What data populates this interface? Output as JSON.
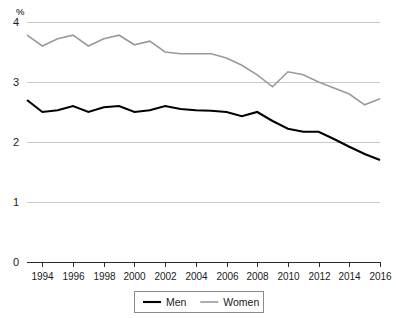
{
  "chart_data": {
    "type": "line",
    "title": "",
    "subtitle": "",
    "xlabel": "",
    "ylabel": "%",
    "unit_label": "%",
    "grid": true,
    "legend_position": "bottom",
    "xlim": [
      1993,
      2016
    ],
    "ylim": [
      0,
      4
    ],
    "ytick_labels": [
      "0",
      "1",
      "2",
      "3",
      "4"
    ],
    "ytick_values": [
      0,
      1,
      2,
      3,
      4
    ],
    "xtick_labels": [
      "1994",
      "1996",
      "1998",
      "2000",
      "2002",
      "2004",
      "2006",
      "2008",
      "2010",
      "2012",
      "2014",
      "2016"
    ],
    "xtick_values": [
      1994,
      1996,
      1998,
      2000,
      2002,
      2004,
      2006,
      2008,
      2010,
      2012,
      2014,
      2016
    ],
    "x": [
      1993,
      1994,
      1995,
      1996,
      1997,
      1998,
      1999,
      2000,
      2001,
      2002,
      2003,
      2004,
      2005,
      2006,
      2007,
      2008,
      2009,
      2010,
      2011,
      2012,
      2013,
      2014,
      2015,
      2016
    ],
    "series": [
      {
        "name": "Men",
        "color": "#000000",
        "width": 2.1,
        "values": [
          2.7,
          2.5,
          2.53,
          2.6,
          2.5,
          2.58,
          2.6,
          2.5,
          2.53,
          2.6,
          2.55,
          2.53,
          2.52,
          2.5,
          2.43,
          2.5,
          2.35,
          2.22,
          2.17,
          2.17,
          2.05,
          1.92,
          1.8,
          1.7
        ]
      },
      {
        "name": "Women",
        "color": "#9a9a9a",
        "width": 1.6,
        "values": [
          3.78,
          3.6,
          3.72,
          3.78,
          3.6,
          3.72,
          3.78,
          3.62,
          3.68,
          3.5,
          3.47,
          3.47,
          3.47,
          3.4,
          3.28,
          3.12,
          2.92,
          3.17,
          3.12,
          3.0,
          2.9,
          2.8,
          2.62,
          2.72
        ]
      }
    ],
    "legend_entries": [
      {
        "label": "Men",
        "color": "#000000"
      },
      {
        "label": "Women",
        "color": "#9a9a9a"
      }
    ]
  },
  "series_men_full": {
    "note": "",
    "values": [
      2.7,
      2.5,
      2.53,
      2.6,
      2.5,
      2.58,
      2.6,
      2.5,
      2.53,
      2.6,
      2.55,
      2.53,
      2.52,
      2.5,
      2.43,
      2.5,
      2.35,
      2.22,
      2.17,
      2.17,
      2.05,
      1.92,
      1.8,
      1.7,
      1.7,
      1.72,
      1.6,
      1.6,
      1.62,
      1.72,
      1.6
    ]
  }
}
